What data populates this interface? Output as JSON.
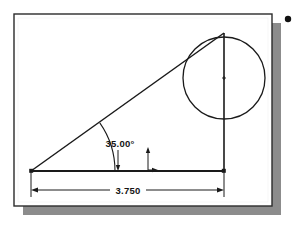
{
  "document": {
    "type": "cad-technical-drawing",
    "background_color": "#ffffff",
    "page": {
      "fill_color": "#ffffff",
      "border_color": "#2b2b2b",
      "shadow_color": "#8c8c8c",
      "x": 14,
      "y": 14,
      "width": 258,
      "height": 192,
      "shadow_offset": 9
    },
    "bullet_marker": {
      "name": "bullet-dot",
      "color": "#111111",
      "cx": 288,
      "cy": 19,
      "r": 3.2
    }
  },
  "geometry": {
    "line_color": "#1a1a1a",
    "triangle": {
      "label": "right-triangle",
      "vertices": {
        "left": {
          "x": 31,
          "y": 171
        },
        "apex": {
          "x": 224,
          "y": 33
        },
        "right": {
          "x": 224,
          "y": 171
        }
      }
    },
    "circle": {
      "label": "tangent-circle",
      "cx": 224,
      "cy": 78,
      "r": 41
    },
    "center_mark": {
      "label": "circle-center-mark",
      "cx": 224,
      "cy": 78,
      "size": 4
    },
    "vertical_axis": {
      "label": "vertical-construction-line",
      "x": 224,
      "y1": 33,
      "y2": 171
    }
  },
  "annotations": {
    "angle_dimension": {
      "name": "angle-dimension",
      "value": "35.00°",
      "text_x": 120,
      "text_y": 147,
      "arc": {
        "cx": 31,
        "cy": 171,
        "r": 84,
        "start_deg": 0,
        "end_deg": 35
      },
      "leader": {
        "x1": 118,
        "y1": 150,
        "x2": 118,
        "y2": 171
      }
    },
    "linear_dimension": {
      "name": "linear-dimension-width",
      "value": "3.750",
      "text_x": 128,
      "text_y": 194,
      "line_y": 190,
      "x1": 31,
      "x2": 224,
      "ext_left_x": 31,
      "ext_right_x": 224,
      "ext_top_y": 171,
      "ext_bottom_y": 197
    },
    "height_marker": {
      "name": "height-leader-marker",
      "x": 148,
      "y_top": 147,
      "y_bottom": 170,
      "tick_x2": 158
    }
  }
}
